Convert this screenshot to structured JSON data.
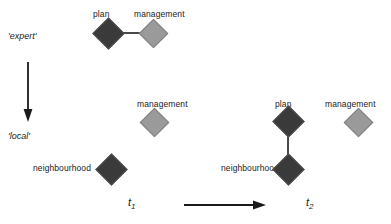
{
  "diagram": {
    "axes": {
      "vertical": {
        "top_label": "'expert'",
        "bottom_label": "'local'",
        "arrow": "down-arrow"
      },
      "horizontal": {
        "left_label": "t",
        "left_label_sub": "1",
        "right_label": "t",
        "right_label_sub": "2",
        "arrow": "right-arrow"
      }
    },
    "colors": {
      "dark_node": "#3a3a3a",
      "light_node": "#9a9a9a",
      "node_stroke": "#555555",
      "edge": "#4a4a4a",
      "text": "#1a1a1a",
      "background": "#ffffff"
    },
    "groups": [
      {
        "name": "t1-expert-cluster",
        "nodes": [
          {
            "id": "t1-plan",
            "label": "plan",
            "shade": "dark"
          },
          {
            "id": "t1-management-expert",
            "label": "management",
            "shade": "light"
          }
        ],
        "edges": [
          {
            "from": "t1-plan",
            "to": "t1-management-expert",
            "orientation": "horizontal"
          }
        ]
      },
      {
        "name": "t1-local-cluster",
        "nodes": [
          {
            "id": "t1-management-local",
            "label": "management",
            "shade": "light"
          },
          {
            "id": "t1-neighbourhood",
            "label": "neighbourhood",
            "shade": "dark"
          }
        ],
        "edges": []
      },
      {
        "name": "t2-cluster",
        "nodes": [
          {
            "id": "t2-plan",
            "label": "plan",
            "shade": "dark"
          },
          {
            "id": "t2-neighbourhood",
            "label": "neighbourhood",
            "shade": "dark"
          },
          {
            "id": "t2-management",
            "label": "management",
            "shade": "light"
          }
        ],
        "edges": [
          {
            "from": "t2-plan",
            "to": "t2-neighbourhood",
            "orientation": "vertical"
          }
        ]
      }
    ]
  }
}
